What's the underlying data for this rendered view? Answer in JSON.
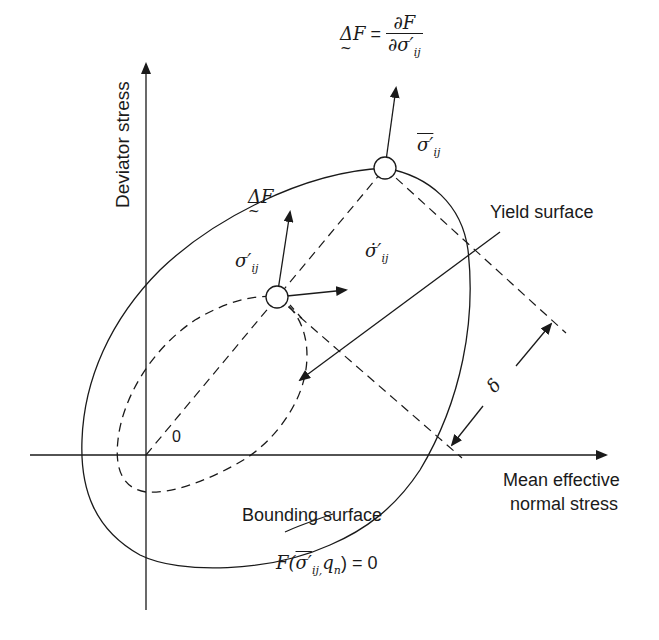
{
  "diagram": {
    "axes": {
      "y_label": "Deviator stress",
      "x_label_line1": "Mean effective",
      "x_label_line2": "normal stress",
      "origin_label": "0"
    },
    "surfaces": {
      "yield_label": "Yield surface",
      "bounding_label": "Bounding surface",
      "bounding_equation_prefix": "F(",
      "bounding_equation_sigma": "σ′",
      "bounding_equation_sub": "ij,",
      "bounding_equation_q": "q",
      "bounding_equation_qsub": "n",
      "bounding_equation_suffix": ") = 0"
    },
    "vectors": {
      "gradient_top_lhs": "ΔF",
      "gradient_top_eq": " = ",
      "gradient_top_num": "∂F",
      "gradient_top_den_prefix": "∂",
      "gradient_top_den_sigma": "σ′",
      "gradient_top_den_sub": "ij",
      "gradient_yield": "ΔF",
      "stress_yield": "σ′",
      "stress_yield_sub": "ij",
      "stress_rate": "σ̇′",
      "stress_rate_sub": "ij",
      "stress_bound": "σ′",
      "stress_bound_sub": "ij",
      "distance": "δ"
    },
    "colors": {
      "line": "#1a1a1a",
      "background": "#ffffff"
    }
  }
}
